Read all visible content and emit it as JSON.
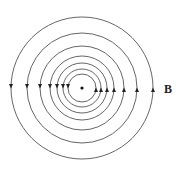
{
  "diagram": {
    "center": {
      "x": 82,
      "y": 88
    },
    "radii": [
      14,
      19,
      25,
      32,
      42,
      55,
      71
    ],
    "line_color": "#555555",
    "arrow_color": "#222222",
    "left_arrow_direction": "down",
    "right_arrow_direction": "up",
    "label": "B"
  }
}
